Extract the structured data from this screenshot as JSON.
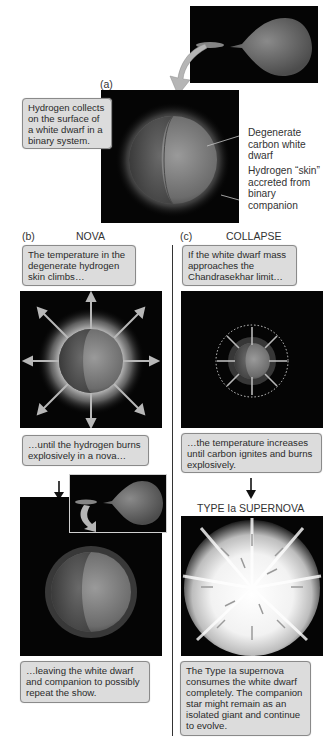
{
  "figure": {
    "panel_a": {
      "label": "(a)",
      "callout": "Hydrogen collects on the surface of a white dwarf in a binary system.",
      "annotations": [
        {
          "text": "Degenerate carbon white dwarf"
        },
        {
          "text": "Hydrogen “skin” accreted from binary companion"
        }
      ],
      "inset": "binary-system-accretion-image"
    },
    "panel_b": {
      "label": "(b)",
      "title": "NOVA",
      "callouts": [
        "The temperature in the degenerate hydrogen skin climbs…",
        "…until the hydrogen burns explosively in a nova…",
        "…leaving the white dwarf and companion to possibly repeat the show."
      ]
    },
    "panel_c": {
      "label": "(c)",
      "title": "COLLAPSE",
      "subtitle": "TYPE Ia SUPERNOVA",
      "callouts": [
        "If the white dwarf mass approaches the Chandrasekhar limit…",
        "…the temperature increases until carbon ignites and burns explosively.",
        "The Type Ia supernova consumes the white dwarf completely. The companion star might remain as an isolated giant and continue to evolve."
      ]
    }
  },
  "colors": {
    "background": "#ffffff",
    "panel_bg": "#050505",
    "callout_bg": "#dcdcdc",
    "callout_border": "#8a8a8a",
    "text": "#2b2b2b"
  }
}
